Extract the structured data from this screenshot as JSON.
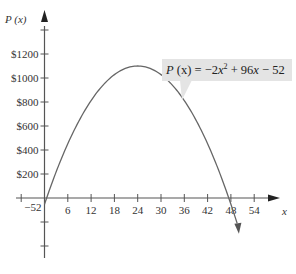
{
  "chart_data": {
    "type": "line",
    "title": "",
    "function": "P(x) = -2x^2 + 96x - 52",
    "annotation": "P (x) = −2x² + 96x − 52",
    "xlabel": "x",
    "ylabel": "P (x)",
    "x_ticks": [
      -6,
      6,
      12,
      18,
      24,
      30,
      36,
      42,
      48,
      54
    ],
    "x_tick_labels": [
      "6",
      "12",
      "18",
      "24",
      "30",
      "36",
      "42",
      "48",
      "54"
    ],
    "y_ticks": [
      200,
      400,
      600,
      800,
      1000,
      1200
    ],
    "y_tick_labels": [
      "$200",
      "$400",
      "$600",
      "$800",
      "$1000",
      "$1200"
    ],
    "y_intercept_label": "−52",
    "xlim": [
      -8,
      60
    ],
    "ylim": [
      -500,
      1400
    ],
    "x": [
      0,
      6,
      12,
      18,
      24,
      30,
      36,
      42,
      48,
      50
    ],
    "values": [
      -52,
      452,
      812,
      1028,
      1100,
      1028,
      812,
      452,
      -52,
      -252
    ],
    "vertex": {
      "x": 24,
      "y": 1100
    },
    "grid": false
  },
  "labels": {
    "y_axis": "P (x)",
    "x_axis": "x",
    "intercept": "−52",
    "eq_P": "P",
    "eq_x": "(x)",
    "eq_rest": " = −2",
    "eq_x2": "x",
    "eq_sup": "2",
    "eq_tail1": " + 96",
    "eq_x3": "x",
    "eq_tail2": " − 52"
  }
}
